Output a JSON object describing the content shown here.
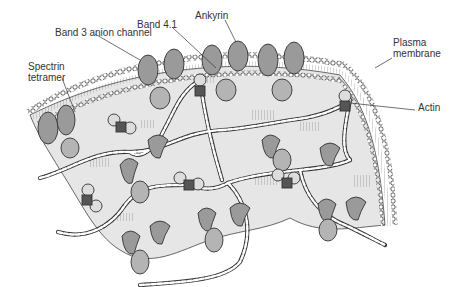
{
  "diagram": {
    "labels": {
      "band3": "Band 3 anion channel",
      "band41": "Band 4.1",
      "ankyrin": "Ankyrin",
      "spectrin_line1": "Spectrin",
      "spectrin_line2": "tetramer",
      "plasma_line1": "Plasma",
      "plasma_line2": "membrane",
      "actin": "Actin"
    },
    "colors": {
      "membrane_fill": "#e6e6e6",
      "protein_fill": "#9a9a9a",
      "protein_light": "#b4b4b4",
      "outline": "#333333",
      "spectrin": "#ffffff",
      "junction": "#555555"
    }
  }
}
